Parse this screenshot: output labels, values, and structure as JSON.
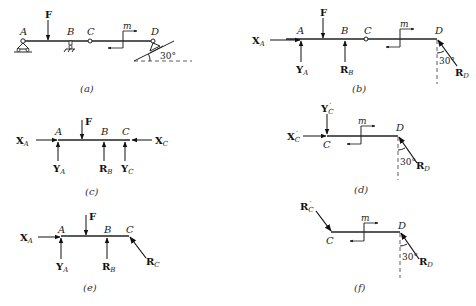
{
  "figure": {
    "a": {
      "caption": "(a)",
      "points": [
        "A",
        "B",
        "C",
        "D"
      ],
      "force": "F",
      "moment": "m",
      "angle": "30°"
    },
    "b": {
      "caption": "(b)",
      "points": [
        "A",
        "B",
        "C",
        "D"
      ],
      "forces": [
        {
          "sym": "X",
          "sub": "A"
        },
        {
          "sym": "Y",
          "sub": "A"
        },
        {
          "sym": "F",
          "sub": ""
        },
        {
          "sym": "R",
          "sub": "B"
        },
        {
          "sym": "R",
          "sub": "D"
        }
      ],
      "moment": "m",
      "angle": "30°"
    },
    "c": {
      "caption": "(c)",
      "points": [
        "A",
        "B",
        "C"
      ],
      "forces": [
        {
          "sym": "X",
          "sub": "A"
        },
        {
          "sym": "Y",
          "sub": "A"
        },
        {
          "sym": "F",
          "sub": ""
        },
        {
          "sym": "R",
          "sub": "B"
        },
        {
          "sym": "Y",
          "sub": "C"
        },
        {
          "sym": "X",
          "sub": "C"
        }
      ]
    },
    "d": {
      "caption": "(d)",
      "points": [
        "C",
        "D"
      ],
      "forces": [
        {
          "sym": "X",
          "sub": "C",
          "prime": "′"
        },
        {
          "sym": "Y",
          "sub": "C",
          "prime": "′"
        },
        {
          "sym": "R",
          "sub": "D"
        }
      ],
      "moment": "m",
      "angle": "30°"
    },
    "e": {
      "caption": "(e)",
      "points": [
        "A",
        "B",
        "C"
      ],
      "forces": [
        {
          "sym": "X",
          "sub": "A"
        },
        {
          "sym": "Y",
          "sub": "A"
        },
        {
          "sym": "F",
          "sub": ""
        },
        {
          "sym": "R",
          "sub": "B"
        },
        {
          "sym": "R",
          "sub": "C"
        }
      ]
    },
    "f": {
      "caption": "(f)",
      "points": [
        "C",
        "D"
      ],
      "forces": [
        {
          "sym": "R",
          "sub": "C",
          "prime": "′"
        },
        {
          "sym": "R",
          "sub": "D"
        }
      ],
      "moment": "m",
      "angle": "30°"
    }
  }
}
